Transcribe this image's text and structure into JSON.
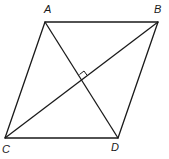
{
  "diagram": {
    "type": "rhombus-with-diagonals",
    "vertices": [
      {
        "id": "A",
        "label": "A",
        "x": 45,
        "y": 22,
        "label_x": 44,
        "label_y": 13
      },
      {
        "id": "B",
        "label": "B",
        "x": 158,
        "y": 22,
        "label_x": 155,
        "label_y": 13
      },
      {
        "id": "C",
        "label": "C",
        "x": 5,
        "y": 138,
        "label_x": 2,
        "label_y": 153
      },
      {
        "id": "D",
        "label": "D",
        "x": 118,
        "y": 138,
        "label_x": 112,
        "label_y": 152
      }
    ],
    "edges": [
      [
        "A",
        "B"
      ],
      [
        "B",
        "D"
      ],
      [
        "D",
        "C"
      ],
      [
        "C",
        "A"
      ]
    ],
    "diagonals": [
      [
        "A",
        "D"
      ],
      [
        "B",
        "C"
      ]
    ],
    "right_angle_marker": {
      "at": "diagonal-intersection",
      "x": 82,
      "y": 79
    },
    "colors": {
      "stroke": "#1a1a1a",
      "background": "#ffffff"
    }
  },
  "labels": {
    "A": "A",
    "B": "B",
    "C": "C",
    "D": "D"
  }
}
